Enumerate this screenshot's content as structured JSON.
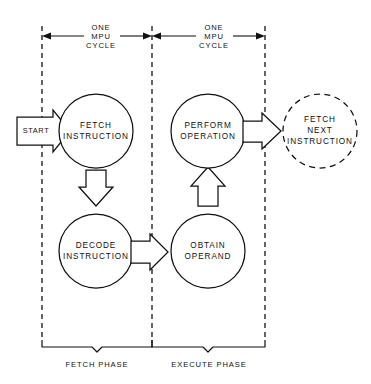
{
  "diagram": {
    "background_color": "#ffffff",
    "line_color": "#111111",
    "cycle_labels": [
      {
        "id": "cycle-left",
        "line1": "ONE",
        "line2": "MPU",
        "line3": "CYCLE"
      },
      {
        "id": "cycle-right",
        "line1": "ONE",
        "line2": "MPU",
        "line3": "CYCLE"
      }
    ],
    "nodes": [
      {
        "id": "fetch-instruction",
        "line1": "FETCH",
        "line2": "INSTRUCTION",
        "line3": "",
        "style": "solid"
      },
      {
        "id": "decode-instruction",
        "line1": "DECODE",
        "line2": "INSTRUCTION",
        "line3": "",
        "style": "solid"
      },
      {
        "id": "obtain-operand",
        "line1": "OBTAIN",
        "line2": "OPERAND",
        "line3": "",
        "style": "solid"
      },
      {
        "id": "perform-operation",
        "line1": "PERFORM",
        "line2": "OPERATION",
        "line3": "",
        "style": "solid"
      },
      {
        "id": "fetch-next-instruction",
        "line1": "FETCH",
        "line2": "NEXT",
        "line3": "INSTRUCTION",
        "style": "dashed"
      }
    ],
    "start_label": "START",
    "phases": [
      {
        "id": "fetch-phase",
        "label": "FETCH PHASE"
      },
      {
        "id": "execute-phase",
        "label": "EXECUTE PHASE"
      }
    ],
    "flow_arrows": [
      {
        "id": "start-to-fetch",
        "direction": "right"
      },
      {
        "id": "fetch-to-decode",
        "direction": "down"
      },
      {
        "id": "decode-to-obtain",
        "direction": "right"
      },
      {
        "id": "obtain-to-perform",
        "direction": "up"
      },
      {
        "id": "perform-to-fetch-next",
        "direction": "right"
      }
    ]
  }
}
